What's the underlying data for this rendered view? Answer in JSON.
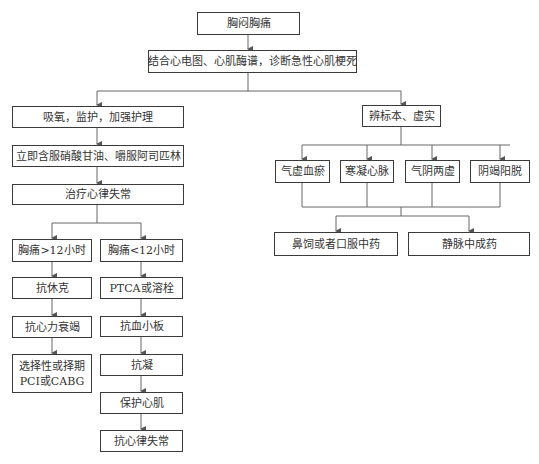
{
  "nodes": {
    "n1": "胸闷胸痛",
    "n2": "结合心电图、心肌酶谱，诊断急性心肌梗死",
    "l1": "吸氧，监护，加强护理",
    "l2": "立即含服硝酸甘油、嚼服阿司匹林",
    "l3": "治疗心律失常",
    "la1": "胸痛>12小时",
    "la2": "抗休克",
    "la3": "抗心力衰竭",
    "la4_line1": "选择性或择期",
    "la4_line2": "PCI或CABG",
    "lb1": "胸痛<12小时",
    "lb2": "PTCA或溶栓",
    "lb3": "抗血小板",
    "lb4": "抗凝",
    "lb5": "保护心肌",
    "lb6": "抗心律失常",
    "r1": "辨标本、虚实",
    "r2a": "气虚血瘀",
    "r2b": "寒凝心脉",
    "r2c": "气阴两虚",
    "r2d": "阴竭阳脱",
    "r3a": "鼻饲或者口服中药",
    "r3b": "静脉中成药"
  },
  "colors": {
    "line": "#555555",
    "border": "#3a3a3a",
    "text": "#333333"
  }
}
